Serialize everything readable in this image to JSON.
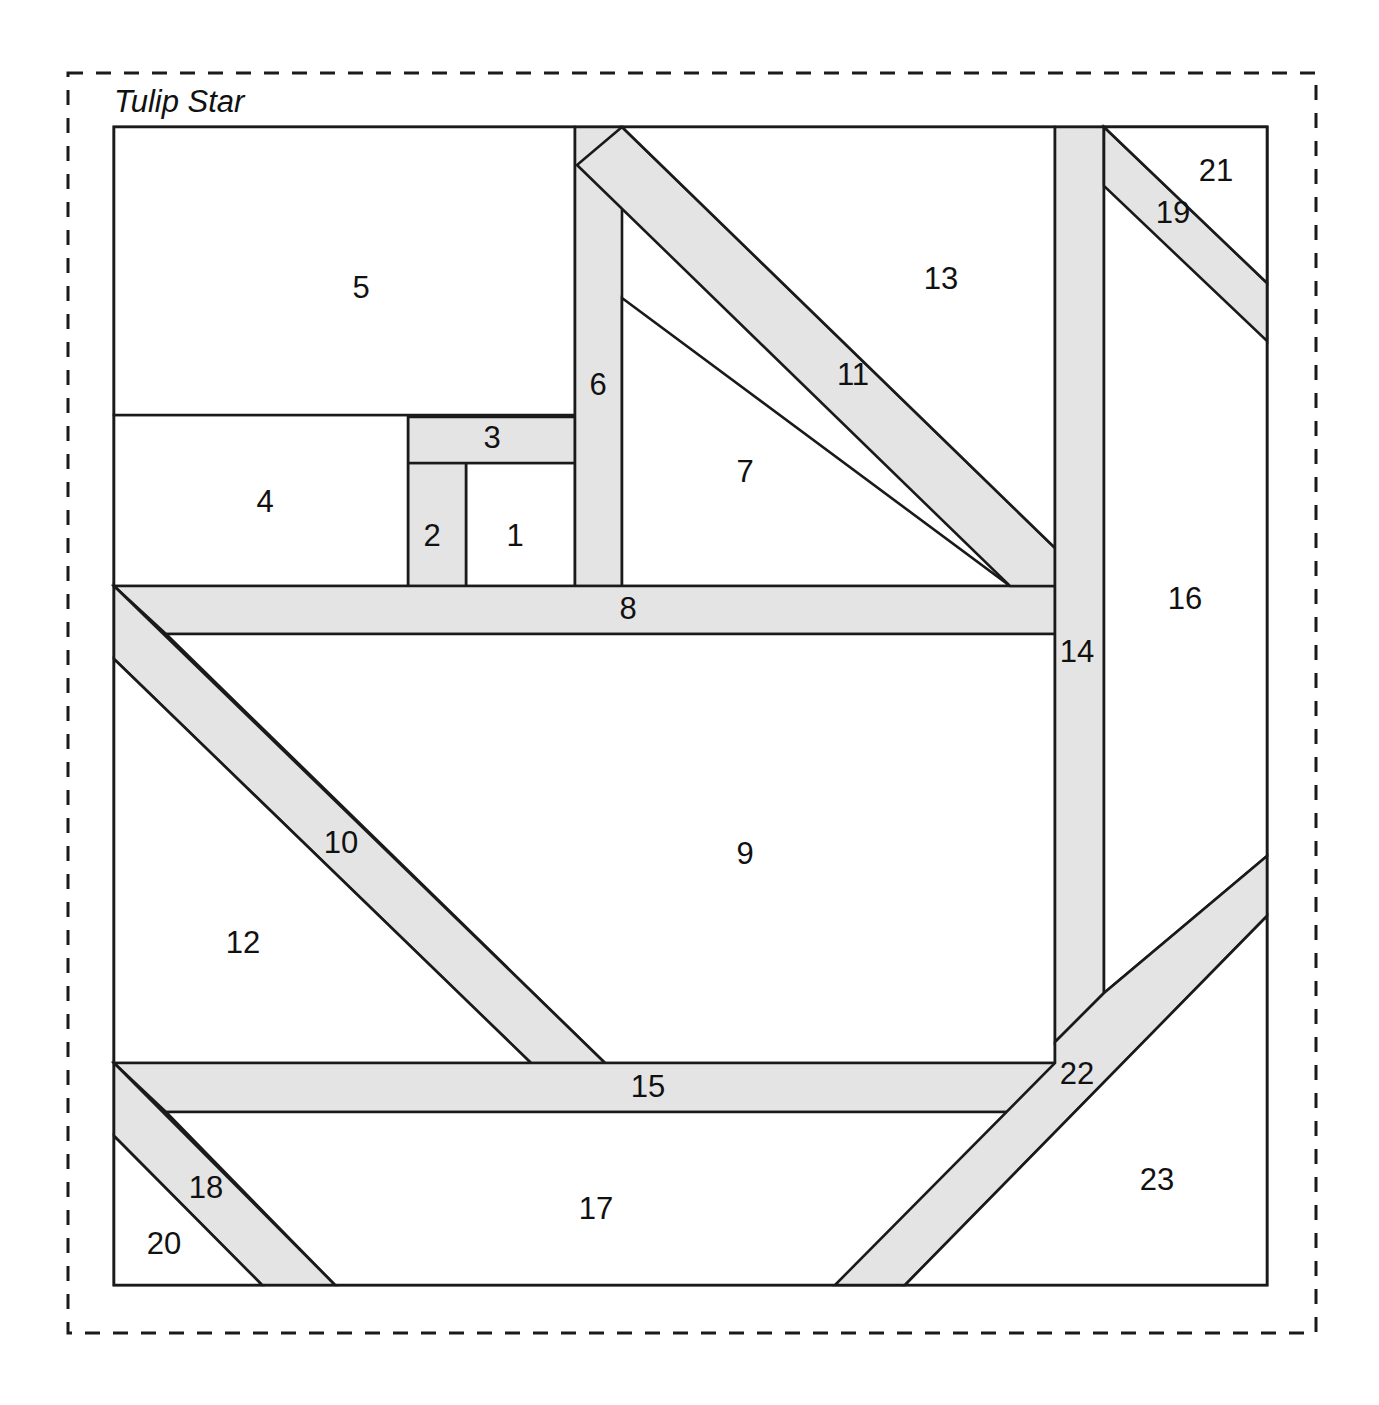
{
  "block": {
    "title": "Tulip Star",
    "colors": {
      "shaded_fill": "#e4e4e4",
      "light_fill": "#ffffff",
      "line": "#1a1a1a",
      "background": "#ffffff"
    },
    "frame": {
      "x": 114,
      "y": 127,
      "width": 1153,
      "height": 1158
    },
    "outer_border": {
      "x": 68,
      "y": 73,
      "width": 1248,
      "height": 1260,
      "style": "dashed"
    },
    "piece_count": 23,
    "pieces": [
      {
        "id": 1,
        "label": "1",
        "shade": "light",
        "label_x": 515,
        "label_y": 538,
        "points": "466,463 575,463 575,586 466,586"
      },
      {
        "id": 2,
        "label": "2",
        "shade": "shaded",
        "label_x": 432,
        "label_y": 538,
        "points": "408,463 466,463 466,586 408,586"
      },
      {
        "id": 3,
        "label": "3",
        "shade": "shaded",
        "label_x": 492,
        "label_y": 440,
        "points": "408,417 575,417 575,463 408,463"
      },
      {
        "id": 4,
        "label": "4",
        "shade": "light",
        "label_x": 265,
        "label_y": 504,
        "points": "114,415 408,415 408,586 114,586"
      },
      {
        "id": 5,
        "label": "5",
        "shade": "light",
        "label_x": 361,
        "label_y": 290,
        "points": "114,127 575,127 575,415 114,415"
      },
      {
        "id": 6,
        "label": "6",
        "shade": "shaded",
        "label_x": 598,
        "label_y": 387,
        "points": "575,127 622,127 622,586 575,586"
      },
      {
        "id": 7,
        "label": "7",
        "shade": "light",
        "label_x": 745,
        "label_y": 474,
        "points": "622,298 1010,586 622,586"
      },
      {
        "id": 8,
        "label": "8",
        "shade": "shaded",
        "label_x": 628,
        "label_y": 611,
        "points": "114,586 1055,586 1055,634 166,634"
      },
      {
        "id": 9,
        "label": "9",
        "shade": "light",
        "label_x": 745,
        "label_y": 856,
        "points": "166,634 1055,634 1055,1063 605,1063"
      },
      {
        "id": 10,
        "label": "10",
        "shade": "shaded",
        "label_x": 341,
        "label_y": 845,
        "points": "114,586 605,1063 531,1063 114,659"
      },
      {
        "id": 11,
        "label": "11",
        "shade": "shaded",
        "label_x": 853,
        "label_y": 377,
        "points": "622,127 1055,548 1055,586 1010,586 577,165"
      },
      {
        "id": 12,
        "label": "12",
        "shade": "light",
        "label_x": 243,
        "label_y": 945,
        "points": "114,659 531,1063 114,1063"
      },
      {
        "id": 13,
        "label": "13",
        "shade": "light",
        "label_x": 941,
        "label_y": 281,
        "points": "622,127 1055,127 1055,548"
      },
      {
        "id": 14,
        "label": "14",
        "shade": "shaded",
        "label_x": 1077,
        "label_y": 654,
        "points": "1055,127 1104,127 1104,993 1055,1042"
      },
      {
        "id": 15,
        "label": "15",
        "shade": "shaded",
        "label_x": 648,
        "label_y": 1089,
        "points": "114,1063 1055,1063 1055,1112 166,1112"
      },
      {
        "id": 16,
        "label": "16",
        "shade": "light",
        "label_x": 1185,
        "label_y": 601,
        "points": "1104,127 1267,127 1267,856 1104,993"
      },
      {
        "id": 17,
        "label": "17",
        "shade": "light",
        "label_x": 596,
        "label_y": 1211,
        "points": "166,1112 1055,1112 905,1285 335,1285"
      },
      {
        "id": 18,
        "label": "18",
        "shade": "shaded",
        "label_x": 206,
        "label_y": 1190,
        "points": "114,1063 335,1285 262,1285 114,1136"
      },
      {
        "id": 19,
        "label": "19",
        "shade": "shaded",
        "label_x": 1173,
        "label_y": 215,
        "points": "1104,127 1267,283 1267,341 1104,186"
      },
      {
        "id": 20,
        "label": "20",
        "shade": "light",
        "label_x": 164,
        "label_y": 1246,
        "points": "114,1136 262,1285 114,1285"
      },
      {
        "id": 21,
        "label": "21",
        "shade": "light",
        "label_x": 1216,
        "label_y": 173,
        "points": "1104,127 1267,127 1267,283"
      },
      {
        "id": 22,
        "label": "22",
        "shade": "shaded",
        "label_x": 1077,
        "label_y": 1076,
        "points": "1267,856 1267,916 905,1285 835,1285 1055,1063 1055,1042 1104,993"
      },
      {
        "id": 23,
        "label": "23",
        "shade": "light",
        "label_x": 1157,
        "label_y": 1182,
        "points": "1267,916 1267,1285 905,1285"
      }
    ]
  }
}
